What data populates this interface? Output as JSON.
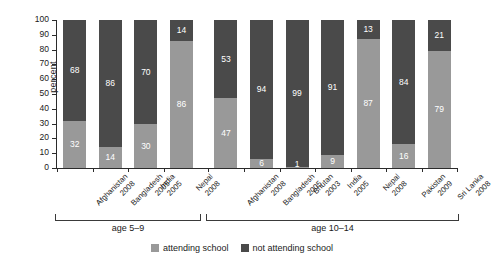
{
  "chart_data": {
    "type": "bar",
    "title": "",
    "subtitle": "",
    "xlabel": "",
    "ylabel": "percent",
    "ylim": [
      0,
      100
    ],
    "yticks": [
      0,
      10,
      20,
      30,
      40,
      50,
      60,
      70,
      80,
      90,
      100
    ],
    "grid": false,
    "stacked": true,
    "legend_position": "bottom-center",
    "series": [
      {
        "name": "attending school",
        "color": "#999999",
        "values": [
          32,
          14,
          30,
          86,
          47,
          6,
          1,
          9,
          87,
          16,
          79
        ]
      },
      {
        "name": "not attending school",
        "color": "#4a4a4a",
        "values": [
          68,
          86,
          70,
          14,
          53,
          94,
          99,
          91,
          13,
          84,
          21
        ]
      }
    ],
    "categories": [
      {
        "country": "Afghanistan",
        "year": "2008",
        "group": "age 5–9"
      },
      {
        "country": "Bangladesh",
        "year": "2005",
        "group": "age 5–9"
      },
      {
        "country": "India",
        "year": "2005",
        "group": "age 5–9"
      },
      {
        "country": "Nepal",
        "year": "2008",
        "group": "age 5–9"
      },
      {
        "country": "Afghanistan",
        "year": "2008",
        "group": "age 10–14"
      },
      {
        "country": "Bangladesh",
        "year": "2005",
        "group": "age 10–14"
      },
      {
        "country": "Bhutan",
        "year": "2003",
        "group": "age 10–14"
      },
      {
        "country": "India",
        "year": "2005",
        "group": "age 10–14"
      },
      {
        "country": "Nepal",
        "year": "2008",
        "group": "age 10–14"
      },
      {
        "country": "Pakistan",
        "year": "2009",
        "group": "age 10–14"
      },
      {
        "country": "Sri Lanka",
        "year": "2008",
        "group": "age 10–14"
      }
    ],
    "groups": [
      {
        "label": "age 5–9",
        "start_index": 0,
        "end_index": 3
      },
      {
        "label": "age 10–14",
        "start_index": 4,
        "end_index": 10
      }
    ],
    "legend": [
      {
        "label": "attending school",
        "color": "#999999"
      },
      {
        "label": "not attending school",
        "color": "#4a4a4a"
      }
    ],
    "colors": {
      "attending": "#999999",
      "not_attending": "#4a4a4a",
      "axis": "#2b2b2b",
      "text": "#1a1a1a",
      "background": "#ffffff"
    }
  }
}
